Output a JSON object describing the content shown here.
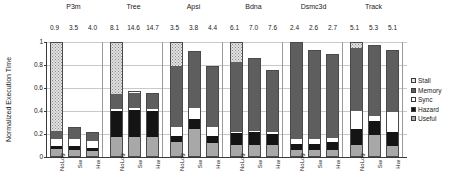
{
  "chart_data": {
    "type": "bar",
    "subtype": "stacked-bar-grouped",
    "title": "",
    "xlabel": "",
    "ylabel": "Normalized Execution Time",
    "ylim": [
      0,
      1
    ],
    "ytick_labels": [
      "0",
      "0.2",
      "0.4",
      "0.6",
      "0.8",
      "1"
    ],
    "ytick_values": [
      0,
      0.2,
      0.4,
      0.6,
      0.8,
      1
    ],
    "grid": true,
    "legend_position": "right",
    "legend": [
      "Stall",
      "Memory",
      "Sync",
      "Hazard",
      "Useful"
    ],
    "stack_order_bottom_to_top": [
      "Useful",
      "Hazard",
      "Sync",
      "Memory",
      "Stall"
    ],
    "configurations": [
      "NoLog",
      "Sw",
      "Hw"
    ],
    "categories": [
      "P3m",
      "Tree",
      "Apsi",
      "Bdna",
      "Dsmc3d",
      "Track"
    ],
    "groups": [
      {
        "name": "P3m",
        "value_labels": [
          "0.9",
          "3.5",
          "4.0"
        ],
        "bars": [
          {
            "config": "NoLog",
            "total": 1.0,
            "Useful": 0.06,
            "Hazard": 0.03,
            "Sync": 0.06,
            "Memory": 0.07,
            "Stall": 0.78
          },
          {
            "config": "Sw",
            "total": 0.26,
            "Useful": 0.06,
            "Hazard": 0.03,
            "Sync": 0.07,
            "Memory": 0.1,
            "Stall": 0.0
          },
          {
            "config": "Hw",
            "total": 0.22,
            "Useful": 0.05,
            "Hazard": 0.03,
            "Sync": 0.06,
            "Memory": 0.08,
            "Stall": 0.0
          }
        ]
      },
      {
        "name": "Tree",
        "value_labels": [
          "8.1",
          "14.6",
          "14.7"
        ],
        "bars": [
          {
            "config": "NoLog",
            "total": 1.0,
            "Useful": 0.17,
            "Hazard": 0.23,
            "Sync": 0.02,
            "Memory": 0.13,
            "Stall": 0.45
          },
          {
            "config": "Sw",
            "total": 0.57,
            "Useful": 0.17,
            "Hazard": 0.24,
            "Sync": 0.02,
            "Memory": 0.14,
            "Stall": 0.0
          },
          {
            "config": "Hw",
            "total": 0.56,
            "Useful": 0.17,
            "Hazard": 0.23,
            "Sync": 0.02,
            "Memory": 0.14,
            "Stall": 0.0
          }
        ]
      },
      {
        "name": "Apsi",
        "value_labels": [
          "3.5",
          "3.8",
          "4.4"
        ],
        "bars": [
          {
            "config": "NoLog",
            "total": 1.0,
            "Useful": 0.12,
            "Hazard": 0.06,
            "Sync": 0.08,
            "Memory": 0.54,
            "Stall": 0.2
          },
          {
            "config": "Sw",
            "total": 0.92,
            "Useful": 0.24,
            "Hazard": 0.09,
            "Sync": 0.1,
            "Memory": 0.49,
            "Stall": 0.0
          },
          {
            "config": "Hw",
            "total": 0.79,
            "Useful": 0.12,
            "Hazard": 0.06,
            "Sync": 0.08,
            "Memory": 0.53,
            "Stall": 0.0
          }
        ]
      },
      {
        "name": "Bdna",
        "value_labels": [
          "6.1",
          "7.0",
          "7.6"
        ],
        "bars": [
          {
            "config": "NoLog",
            "total": 1.0,
            "Useful": 0.1,
            "Hazard": 0.1,
            "Sync": 0.01,
            "Memory": 0.62,
            "Stall": 0.17
          },
          {
            "config": "Sw",
            "total": 0.86,
            "Useful": 0.1,
            "Hazard": 0.11,
            "Sync": 0.01,
            "Memory": 0.64,
            "Stall": 0.0
          },
          {
            "config": "Hw",
            "total": 0.76,
            "Useful": 0.1,
            "Hazard": 0.1,
            "Sync": 0.01,
            "Memory": 0.55,
            "Stall": 0.0
          }
        ]
      },
      {
        "name": "Dsmc3d",
        "value_labels": [
          "2.4",
          "2.6",
          "2.7"
        ],
        "bars": [
          {
            "config": "NoLog",
            "total": 1.0,
            "Useful": 0.05,
            "Hazard": 0.06,
            "Sync": 0.04,
            "Memory": 0.85,
            "Stall": 0.0
          },
          {
            "config": "Sw",
            "total": 0.93,
            "Useful": 0.05,
            "Hazard": 0.06,
            "Sync": 0.04,
            "Memory": 0.78,
            "Stall": 0.0
          },
          {
            "config": "Hw",
            "total": 0.9,
            "Useful": 0.05,
            "Hazard": 0.07,
            "Sync": 0.04,
            "Memory": 0.74,
            "Stall": 0.0
          }
        ]
      },
      {
        "name": "Track",
        "value_labels": [
          "5.1",
          "5.3",
          "5.1"
        ],
        "bars": [
          {
            "config": "NoLog",
            "total": 1.0,
            "Useful": 0.1,
            "Hazard": 0.14,
            "Sync": 0.16,
            "Memory": 0.56,
            "Stall": 0.04
          },
          {
            "config": "Sw",
            "total": 0.97,
            "Useful": 0.19,
            "Hazard": 0.12,
            "Sync": 0.04,
            "Memory": 0.62,
            "Stall": 0.0
          },
          {
            "config": "Hw",
            "total": 0.93,
            "Useful": 0.09,
            "Hazard": 0.12,
            "Sync": 0.18,
            "Memory": 0.54,
            "Stall": 0.0
          }
        ]
      }
    ]
  },
  "colors": {
    "stall": "#e2e2e2",
    "memory": "#5e5e5e",
    "sync": "#ffffff",
    "hazard": "#141414",
    "useful": "#a8a8a8",
    "axis": "#3a3a3a",
    "grid": "#c9c9c9"
  }
}
